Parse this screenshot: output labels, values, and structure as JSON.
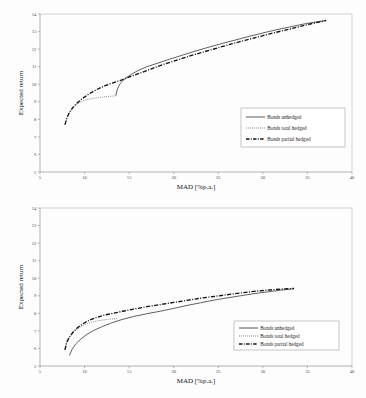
{
  "chart_data": [
    {
      "id": "top",
      "type": "line",
      "title": "",
      "xlabel": "MAD [%p.a.]",
      "ylabel": "Expected return",
      "xlim": [
        5,
        40
      ],
      "ylim": [
        5,
        14
      ],
      "xticks": [
        5,
        10,
        15,
        20,
        25,
        30,
        35,
        40
      ],
      "yticks": [
        5,
        6,
        7,
        8,
        9,
        10,
        11,
        12,
        13,
        14
      ],
      "grid": false,
      "legend_position": "center-right",
      "series": [
        {
          "name": "Bonds unhedged",
          "style": "solid",
          "points": [
            [
              13.5,
              9.35
            ],
            [
              13.7,
              9.75
            ],
            [
              14.0,
              10.05
            ],
            [
              14.5,
              10.3
            ],
            [
              15.2,
              10.55
            ],
            [
              16.0,
              10.78
            ],
            [
              17.0,
              11.0
            ],
            [
              18.2,
              11.2
            ],
            [
              19.5,
              11.42
            ],
            [
              21.0,
              11.66
            ],
            [
              22.5,
              11.9
            ],
            [
              24.0,
              12.12
            ],
            [
              25.5,
              12.33
            ],
            [
              27.0,
              12.53
            ],
            [
              28.5,
              12.73
            ],
            [
              30.0,
              12.92
            ],
            [
              31.5,
              13.1
            ],
            [
              33.0,
              13.26
            ],
            [
              34.5,
              13.42
            ],
            [
              36.0,
              13.55
            ],
            [
              37.1,
              13.63
            ]
          ]
        },
        {
          "name": "Bonds total hedged",
          "style": "dotted",
          "points": [
            [
              7.8,
              7.7
            ],
            [
              8.0,
              8.05
            ],
            [
              8.3,
              8.38
            ],
            [
              8.7,
              8.65
            ],
            [
              9.2,
              8.88
            ],
            [
              9.7,
              9.02
            ],
            [
              10.3,
              9.13
            ],
            [
              11.0,
              9.2
            ],
            [
              11.8,
              9.25
            ],
            [
              12.6,
              9.3
            ],
            [
              13.3,
              9.33
            ],
            [
              13.6,
              9.35
            ]
          ]
        },
        {
          "name": "Bonds partial hedged",
          "style": "dashdot",
          "points": [
            [
              7.8,
              7.7
            ],
            [
              8.0,
              8.05
            ],
            [
              8.3,
              8.4
            ],
            [
              8.7,
              8.68
            ],
            [
              9.2,
              8.95
            ],
            [
              9.8,
              9.2
            ],
            [
              10.5,
              9.45
            ],
            [
              11.3,
              9.68
            ],
            [
              12.2,
              9.9
            ],
            [
              13.2,
              10.08
            ],
            [
              14.2,
              10.25
            ],
            [
              15.2,
              10.45
            ],
            [
              16.3,
              10.65
            ],
            [
              17.5,
              10.88
            ],
            [
              19.0,
              11.15
            ],
            [
              20.5,
              11.4
            ],
            [
              22.0,
              11.64
            ],
            [
              23.5,
              11.86
            ],
            [
              25.0,
              12.08
            ],
            [
              26.5,
              12.3
            ],
            [
              28.0,
              12.5
            ],
            [
              29.5,
              12.7
            ],
            [
              31.0,
              12.9
            ],
            [
              32.5,
              13.08
            ],
            [
              34.0,
              13.27
            ],
            [
              35.5,
              13.45
            ],
            [
              37.1,
              13.63
            ]
          ]
        }
      ]
    },
    {
      "id": "bottom",
      "type": "line",
      "title": "",
      "xlabel": "MAD [%p.a.]",
      "ylabel": "Expected return",
      "xlim": [
        5,
        40
      ],
      "ylim": [
        5,
        14
      ],
      "xticks": [
        5,
        10,
        15,
        20,
        25,
        30,
        35,
        40
      ],
      "yticks": [
        5,
        6,
        7,
        8,
        9,
        10,
        11,
        12,
        13,
        14
      ],
      "grid": false,
      "legend_position": "lower-right",
      "series": [
        {
          "name": "Bonds unhedged",
          "style": "solid",
          "points": [
            [
              8.3,
              5.6
            ],
            [
              8.6,
              5.95
            ],
            [
              9.0,
              6.25
            ],
            [
              9.5,
              6.5
            ],
            [
              10.2,
              6.78
            ],
            [
              11.0,
              7.02
            ],
            [
              12.0,
              7.25
            ],
            [
              13.0,
              7.45
            ],
            [
              14.2,
              7.65
            ],
            [
              15.5,
              7.82
            ],
            [
              17.0,
              7.98
            ],
            [
              18.5,
              8.12
            ],
            [
              20.0,
              8.28
            ],
            [
              21.5,
              8.45
            ],
            [
              23.0,
              8.6
            ],
            [
              24.5,
              8.75
            ],
            [
              26.0,
              8.88
            ],
            [
              27.5,
              9.0
            ],
            [
              29.0,
              9.12
            ],
            [
              30.5,
              9.22
            ],
            [
              32.0,
              9.32
            ],
            [
              33.5,
              9.4
            ]
          ]
        },
        {
          "name": "Bonds total hedged",
          "style": "dotted",
          "points": [
            [
              7.8,
              5.95
            ],
            [
              8.0,
              6.35
            ],
            [
              8.3,
              6.62
            ],
            [
              8.7,
              6.88
            ],
            [
              9.2,
              7.12
            ],
            [
              9.8,
              7.3
            ],
            [
              10.5,
              7.45
            ],
            [
              11.3,
              7.56
            ],
            [
              12.2,
              7.63
            ],
            [
              13.0,
              7.68
            ],
            [
              13.7,
              7.7
            ]
          ]
        },
        {
          "name": "Bonds partial hedged",
          "style": "dashdot",
          "points": [
            [
              7.8,
              5.92
            ],
            [
              8.0,
              6.35
            ],
            [
              8.3,
              6.65
            ],
            [
              8.7,
              6.92
            ],
            [
              9.2,
              7.18
            ],
            [
              9.8,
              7.4
            ],
            [
              10.5,
              7.6
            ],
            [
              11.3,
              7.76
            ],
            [
              12.2,
              7.9
            ],
            [
              13.2,
              8.0
            ],
            [
              14.3,
              8.12
            ],
            [
              15.5,
              8.24
            ],
            [
              17.0,
              8.38
            ],
            [
              18.5,
              8.5
            ],
            [
              20.0,
              8.62
            ],
            [
              21.5,
              8.74
            ],
            [
              23.0,
              8.86
            ],
            [
              24.5,
              8.96
            ],
            [
              26.0,
              9.06
            ],
            [
              27.5,
              9.16
            ],
            [
              29.0,
              9.25
            ],
            [
              30.5,
              9.32
            ],
            [
              32.0,
              9.38
            ],
            [
              33.5,
              9.42
            ]
          ]
        }
      ]
    }
  ],
  "legend": {
    "entries": [
      "Bonds unhedged",
      "Bonds total hedged",
      "Bonds partial hedged"
    ]
  },
  "axis": {
    "xlabel": "MAD [%p.a.]",
    "ylabel": "Expected return"
  },
  "colors": {
    "solid": "#2b2b2f",
    "dotted": "#5a5a5e",
    "dashdot": "#121216",
    "axis": "#8f8f93",
    "background": "#fdfdfd"
  }
}
